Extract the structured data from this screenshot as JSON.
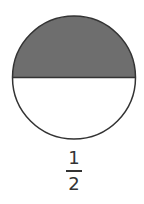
{
  "figure": {
    "shape": "circle",
    "parts": 2,
    "shaded_parts": 1,
    "shaded_region": "top-half",
    "shade_color": "#6e6e6e",
    "outline_color": "#333333"
  },
  "fraction": {
    "numerator": "1",
    "denominator": "2"
  }
}
